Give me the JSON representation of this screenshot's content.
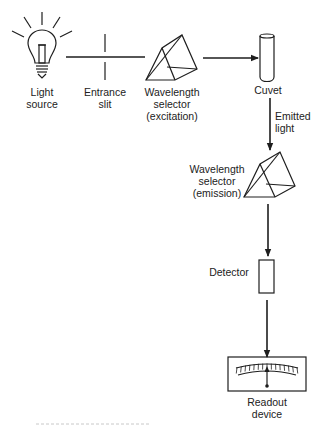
{
  "diagram": {
    "type": "fluorometer block diagram",
    "components": [
      {
        "id": "light-source",
        "label": "Light\nsource"
      },
      {
        "id": "entrance-slit",
        "label": "Entrance\nslit"
      },
      {
        "id": "excitation-selector",
        "label": "Wavelength\nselector\n(excitation)"
      },
      {
        "id": "cuvet",
        "label": "Cuvet"
      },
      {
        "id": "emission-selector",
        "label": "Wavelength\nselector\n(emission)"
      },
      {
        "id": "detector",
        "label": "Detector"
      },
      {
        "id": "readout",
        "label": "Readout\ndevice"
      }
    ],
    "edges": [
      {
        "from": "light-source",
        "to": "entrance-slit",
        "label": ""
      },
      {
        "from": "entrance-slit",
        "to": "excitation-selector",
        "label": ""
      },
      {
        "from": "excitation-selector",
        "to": "cuvet",
        "label": ""
      },
      {
        "from": "cuvet",
        "to": "emission-selector",
        "label": "Emitted\nlight"
      },
      {
        "from": "emission-selector",
        "to": "detector",
        "label": ""
      },
      {
        "from": "detector",
        "to": "readout",
        "label": ""
      }
    ]
  },
  "colors": {
    "ink": "#1e1e1e",
    "background": "#ffffff",
    "caption_smudge": "#c8c8c8"
  }
}
